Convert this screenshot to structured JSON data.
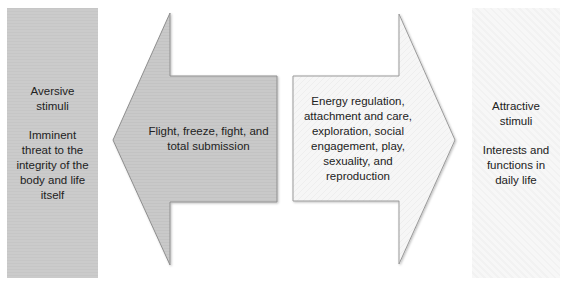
{
  "diagram": {
    "type": "opposing-arrows",
    "colors": {
      "left_fill": "#c9c9c9",
      "right_fill": "#f5f5f5",
      "outline": "#8a8a8a",
      "text": "#222222"
    },
    "left_panel": {
      "title": "Aversive stimuli",
      "title_line1": "Aversive",
      "title_line2": "stimuli",
      "description": "Imminent threat to the integrity of the body and life itself",
      "desc_line1": "Imminent",
      "desc_line2": "threat to the",
      "desc_line3": "integrity of the",
      "desc_line4": "body and life",
      "desc_line5": "itself"
    },
    "left_arrow": {
      "direction": "left",
      "text": "Flight, freeze, fight, and total submission",
      "line1": "Flight, freeze, fight, and",
      "line2": "total submission"
    },
    "right_arrow": {
      "direction": "right",
      "text": "Energy regulation, attachment and care, exploration, social engagement, play, sexuality, and reproduction",
      "line1": "Energy regulation,",
      "line2": "attachment and care,",
      "line3": "exploration, social",
      "line4": "engagement, play,",
      "line5": "sexuality, and",
      "line6": "reproduction"
    },
    "right_panel": {
      "title": "Attractive stimuli",
      "title_line1": "Attractive",
      "title_line2": "stimuli",
      "description": "Interests and functions in daily life",
      "desc_line1": "Interests and",
      "desc_line2": "functions in",
      "desc_line3": "daily life"
    }
  }
}
